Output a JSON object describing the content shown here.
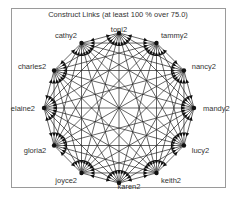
{
  "title": "Construct Links (at least 100 % over 75.0)",
  "graph": {
    "type": "complete-directed-circular",
    "center": [
      119,
      108
    ],
    "radius": 75,
    "edge_color": "#222222",
    "nodes": [
      {
        "label": "toni2"
      },
      {
        "label": "tammy2"
      },
      {
        "label": "nancy2"
      },
      {
        "label": "mandy2"
      },
      {
        "label": "lucy2"
      },
      {
        "label": "keith2"
      },
      {
        "label": "karen2"
      },
      {
        "label": "joyce2"
      },
      {
        "label": "gloria2"
      },
      {
        "label": "elaine2"
      },
      {
        "label": "charles2"
      },
      {
        "label": "cathy2"
      }
    ]
  }
}
